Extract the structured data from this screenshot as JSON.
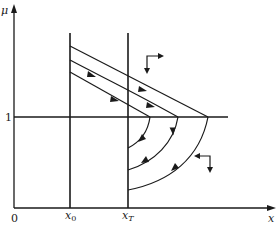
{
  "diagram": {
    "type": "phase-portrait",
    "axes": {
      "y_label": "μ",
      "x_label": "x",
      "origin_label": "0",
      "y_tick_label": "1"
    },
    "vertical_lines": [
      {
        "label": "x",
        "subscript": "0"
      },
      {
        "label": "x",
        "subscript": "T"
      }
    ],
    "horizontal_line": {
      "value": "1"
    },
    "upper_trajectories": 3,
    "lower_trajectories": 3,
    "direction_indicators": [
      {
        "region": "upper",
        "arrows": [
          "right",
          "down"
        ]
      },
      {
        "region": "lower",
        "arrows": [
          "left",
          "down"
        ]
      }
    ],
    "colors": {
      "stroke": "#1a1a1a",
      "background": "#ffffff"
    }
  }
}
